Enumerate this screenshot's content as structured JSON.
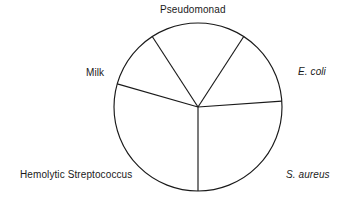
{
  "figure": {
    "title": "",
    "background_color": "#ffffff",
    "line_color": "#1a1a1a",
    "text_color": "#1a1a1a"
  },
  "chart_data": {
    "type": "pie",
    "title": "",
    "subtitle": "",
    "xlabel": "",
    "ylabel": "",
    "legend_position": "around-perimeter",
    "grid": false,
    "center": {
      "x": 198,
      "y": 107
    },
    "radius": 84,
    "categories": [
      "Pseudomonad",
      "E. coli",
      "S. aureus",
      "Hemolytic Streptococcus",
      "Milk"
    ],
    "values": [
      20,
      20,
      20,
      20,
      20
    ],
    "slice_angles_deg": [
      72,
      72,
      72,
      72,
      72
    ],
    "divider_angles_deg": [
      303,
      356,
      90,
      196,
      237
    ],
    "labels": [
      {
        "id": "pseudomonad",
        "text": "Pseudomonad",
        "italic": false,
        "position": "top-center"
      },
      {
        "id": "ecoli",
        "text": "E. coli",
        "italic": true,
        "position": "right"
      },
      {
        "id": "saureus",
        "text": "S. aureus",
        "italic": true,
        "position": "bottom-right"
      },
      {
        "id": "hemolytic",
        "text": "Hemolytic Streptococcus",
        "italic": false,
        "position": "bottom-left"
      },
      {
        "id": "milk",
        "text": "Milk",
        "italic": false,
        "position": "left"
      }
    ]
  }
}
